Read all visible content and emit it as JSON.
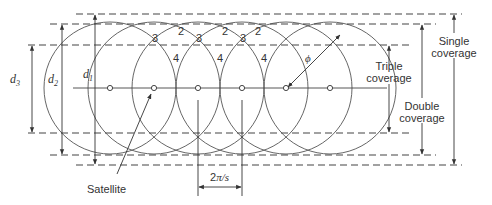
{
  "diagram": {
    "type": "satellite-coverage-street",
    "colors": {
      "line": "#444444",
      "text": "#333333",
      "background": "#ffffff"
    },
    "center_line_y": 88,
    "radius": 66,
    "centers_x": [
      110,
      154,
      198,
      242,
      286,
      330
    ],
    "ground_track": {
      "x1": 73,
      "x2": 387
    },
    "dashed_lines": [
      {
        "id": "single-top",
        "y": 14,
        "x1": 76,
        "x2": 462
      },
      {
        "id": "double-top",
        "y": 24,
        "x1": 50,
        "x2": 436
      },
      {
        "id": "triple-top",
        "y": 45,
        "x1": 28,
        "x2": 412
      },
      {
        "id": "triple-bottom",
        "y": 133,
        "x1": 28,
        "x2": 412
      },
      {
        "id": "double-bottom",
        "y": 155,
        "x1": 50,
        "x2": 436
      },
      {
        "id": "single-bottom",
        "y": 165,
        "x1": 76,
        "x2": 462
      }
    ],
    "region_labels": [
      {
        "text": "3",
        "x": 155,
        "y": 42
      },
      {
        "text": "2",
        "x": 181,
        "y": 35
      },
      {
        "text": "3",
        "x": 199,
        "y": 42
      },
      {
        "text": "2",
        "x": 225,
        "y": 35
      },
      {
        "text": "3",
        "x": 243,
        "y": 42
      },
      {
        "text": "2",
        "x": 258,
        "y": 35
      },
      {
        "text": "4",
        "x": 176,
        "y": 62
      },
      {
        "text": "4",
        "x": 220,
        "y": 62
      },
      {
        "text": "4",
        "x": 264,
        "y": 62
      }
    ],
    "dimensions": {
      "d3": {
        "label": "d",
        "sub": "3",
        "x": 32,
        "y1": 45,
        "y2": 133
      },
      "d2": {
        "label": "d",
        "sub": "2",
        "x": 62,
        "y1": 24,
        "y2": 155
      },
      "d1": {
        "label": "d",
        "sub": "1",
        "x": 95,
        "y1": 14,
        "y2": 165
      }
    },
    "coverage_labels": {
      "triple": {
        "line1": "Triple",
        "line2": "coverage",
        "x": 389
      },
      "double": {
        "line1": "Double",
        "line2": "coverage",
        "x": 422
      },
      "single": {
        "line1": "Single",
        "line2": "coverage",
        "x": 454
      }
    },
    "phi_label": "ϕ",
    "satellite_label": "Satellite",
    "spacing_label": "2π/s"
  }
}
